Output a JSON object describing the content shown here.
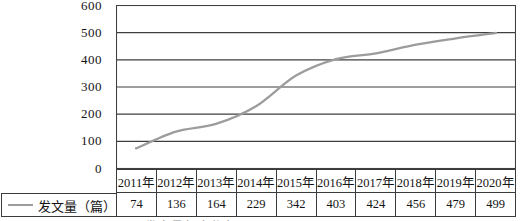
{
  "figure": {
    "legend_label": "发文量（篇）",
    "caption_clipped": "图 发文量年度分布",
    "colors": {
      "series": "#9c9c9c",
      "grid": "#3f3f3f",
      "border": "#3b3b3b",
      "text": "#141414"
    }
  },
  "chart_data": {
    "type": "line",
    "title": "",
    "xlabel": "",
    "ylabel": "",
    "categories": [
      "2011年",
      "2012年",
      "2013年",
      "2014年",
      "2015年",
      "2016年",
      "2017年",
      "2018年",
      "2019年",
      "2020年"
    ],
    "series": [
      {
        "name": "发文量（篇）",
        "values": [
          74,
          136,
          164,
          229,
          342,
          403,
          424,
          456,
          479,
          499
        ]
      }
    ],
    "ylim": [
      0,
      600
    ],
    "ytick_step": 100,
    "yticks": [
      0,
      100,
      200,
      300,
      400,
      500,
      600
    ],
    "grid": true,
    "smooth": true,
    "legend_position": "bottom-left"
  }
}
